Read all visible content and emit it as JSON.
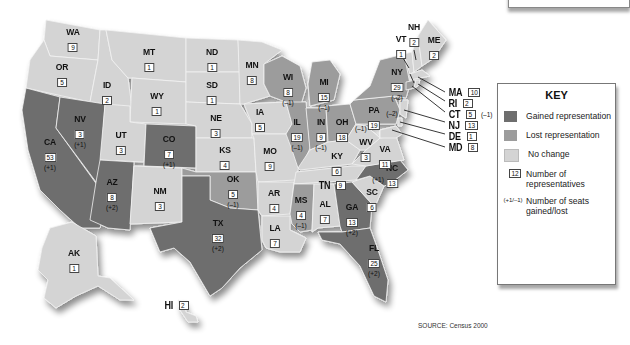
{
  "map": {
    "title": "U.S. House apportionment changes, Census 2000",
    "colors": {
      "gained": "#6e6e6e",
      "lost": "#9c9c9c",
      "no_change": "#d4d4d4"
    },
    "states": [
      {
        "abbr": "WA",
        "reps": "9",
        "change": "",
        "status": "no_change"
      },
      {
        "abbr": "OR",
        "reps": "5",
        "change": "",
        "status": "no_change"
      },
      {
        "abbr": "CA",
        "reps": "53",
        "change": "(+1)",
        "status": "gained"
      },
      {
        "abbr": "ID",
        "reps": "2",
        "change": "",
        "status": "no_change"
      },
      {
        "abbr": "NV",
        "reps": "3",
        "change": "(+1)",
        "status": "gained"
      },
      {
        "abbr": "MT",
        "reps": "1",
        "change": "",
        "status": "no_change"
      },
      {
        "abbr": "WY",
        "reps": "1",
        "change": "",
        "status": "no_change"
      },
      {
        "abbr": "UT",
        "reps": "3",
        "change": "",
        "status": "no_change"
      },
      {
        "abbr": "AZ",
        "reps": "8",
        "change": "(+2)",
        "status": "gained"
      },
      {
        "abbr": "CO",
        "reps": "7",
        "change": "(+1)",
        "status": "gained"
      },
      {
        "abbr": "NM",
        "reps": "3",
        "change": "",
        "status": "no_change"
      },
      {
        "abbr": "ND",
        "reps": "1",
        "change": "",
        "status": "no_change"
      },
      {
        "abbr": "SD",
        "reps": "1",
        "change": "",
        "status": "no_change"
      },
      {
        "abbr": "NE",
        "reps": "3",
        "change": "",
        "status": "no_change"
      },
      {
        "abbr": "KS",
        "reps": "4",
        "change": "",
        "status": "no_change"
      },
      {
        "abbr": "OK",
        "reps": "5",
        "change": "(–1)",
        "status": "lost"
      },
      {
        "abbr": "TX",
        "reps": "32",
        "change": "(+2)",
        "status": "gained"
      },
      {
        "abbr": "MN",
        "reps": "8",
        "change": "",
        "status": "no_change"
      },
      {
        "abbr": "IA",
        "reps": "5",
        "change": "",
        "status": "no_change"
      },
      {
        "abbr": "MO",
        "reps": "9",
        "change": "",
        "status": "no_change"
      },
      {
        "abbr": "AR",
        "reps": "4",
        "change": "",
        "status": "no_change"
      },
      {
        "abbr": "LA",
        "reps": "7",
        "change": "",
        "status": "no_change"
      },
      {
        "abbr": "WI",
        "reps": "8",
        "change": "(–1)",
        "status": "lost"
      },
      {
        "abbr": "IL",
        "reps": "19",
        "change": "(–1)",
        "status": "lost"
      },
      {
        "abbr": "MI",
        "reps": "15",
        "change": "(–1)",
        "status": "lost"
      },
      {
        "abbr": "IN",
        "reps": "9",
        "change": "(–1)",
        "status": "lost"
      },
      {
        "abbr": "OH",
        "reps": "18",
        "change": "(–1)",
        "status": "lost"
      },
      {
        "abbr": "KY",
        "reps": "6",
        "change": "",
        "status": "no_change"
      },
      {
        "abbr": "TN",
        "reps": "9",
        "change": "",
        "status": "no_change"
      },
      {
        "abbr": "MS",
        "reps": "4",
        "change": "(–1)",
        "status": "lost"
      },
      {
        "abbr": "AL",
        "reps": "7",
        "change": "",
        "status": "no_change"
      },
      {
        "abbr": "GA",
        "reps": "13",
        "change": "(+2)",
        "status": "gained"
      },
      {
        "abbr": "FL",
        "reps": "25",
        "change": "(+2)",
        "status": "gained"
      },
      {
        "abbr": "SC",
        "reps": "6",
        "change": "",
        "status": "no_change"
      },
      {
        "abbr": "NC",
        "reps": "13",
        "change": "(+1)",
        "status": "gained"
      },
      {
        "abbr": "VA",
        "reps": "11",
        "change": "",
        "status": "no_change"
      },
      {
        "abbr": "WV",
        "reps": "3",
        "change": "",
        "status": "no_change"
      },
      {
        "abbr": "PA",
        "reps": "19",
        "change": "(–2)",
        "status": "lost"
      },
      {
        "abbr": "NY",
        "reps": "29",
        "change": "(–2)",
        "status": "lost"
      },
      {
        "abbr": "VT",
        "reps": "1",
        "change": "",
        "status": "no_change"
      },
      {
        "abbr": "NH",
        "reps": "2",
        "change": "",
        "status": "no_change"
      },
      {
        "abbr": "ME",
        "reps": "2",
        "change": "",
        "status": "no_change"
      },
      {
        "abbr": "MA",
        "reps": "10",
        "change": "",
        "status": "no_change"
      },
      {
        "abbr": "RI",
        "reps": "2",
        "change": "",
        "status": "no_change"
      },
      {
        "abbr": "CT",
        "reps": "5",
        "change": "(–1)",
        "status": "lost"
      },
      {
        "abbr": "NJ",
        "reps": "13",
        "change": "",
        "status": "no_change"
      },
      {
        "abbr": "DE",
        "reps": "1",
        "change": "",
        "status": "no_change"
      },
      {
        "abbr": "MD",
        "reps": "8",
        "change": "",
        "status": "no_change"
      },
      {
        "abbr": "AK",
        "reps": "1",
        "change": "",
        "status": "no_change"
      },
      {
        "abbr": "HI",
        "reps": "2",
        "change": "",
        "status": "no_change"
      }
    ]
  },
  "key": {
    "title": "KEY",
    "items": [
      {
        "label": "Gained representation",
        "symbol": "swatch-gained"
      },
      {
        "label": "Lost representation",
        "symbol": "swatch-lost"
      },
      {
        "label": "No change",
        "symbol": "swatch-nochange"
      },
      {
        "label": "Number of representatives",
        "symbol": "12"
      },
      {
        "label": "Number of seats gained/lost",
        "symbol": "(+1/–1)"
      }
    ]
  },
  "source": "SOURCE: Census 2000"
}
